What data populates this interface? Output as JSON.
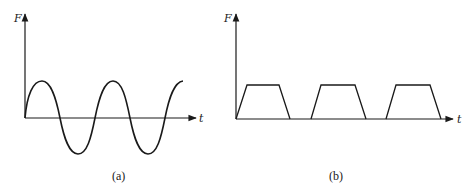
{
  "figures": [
    {
      "id": "a",
      "caption": "(a)",
      "y_axis_label": "F",
      "x_axis_label": "t",
      "waveform": "sinusoidal"
    },
    {
      "id": "b",
      "caption": "(b)",
      "y_axis_label": "F",
      "x_axis_label": "t",
      "waveform": "trapezoidal pulse train"
    }
  ],
  "colors": {
    "line": "#1a1a1a",
    "background": "#ffffff"
  }
}
